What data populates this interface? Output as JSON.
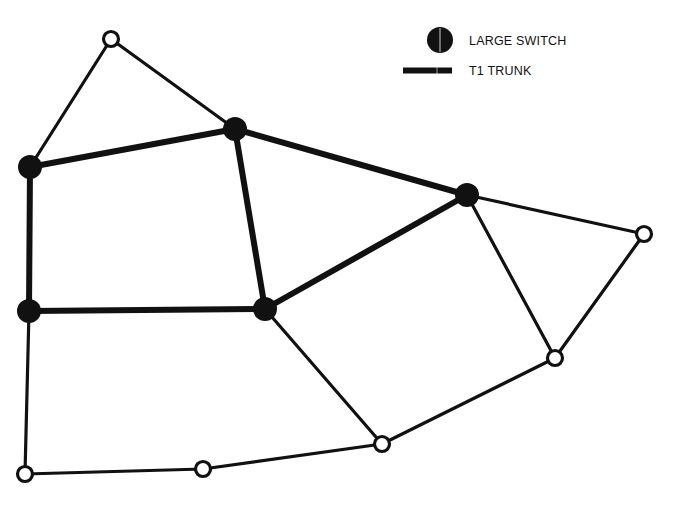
{
  "diagram": {
    "type": "network-topology",
    "colors": {
      "stroke": "#111111",
      "background": "#ffffff",
      "node_fill_open": "#ffffff"
    },
    "legend": {
      "large_switch_label": "LARGE SWITCH",
      "t1_trunk_label": "T1 TRUNK"
    },
    "nodes": [
      {
        "id": "n1",
        "kind": "small",
        "x": 111,
        "y": 39
      },
      {
        "id": "s1",
        "kind": "large-switch",
        "x": 30,
        "y": 167
      },
      {
        "id": "s2",
        "kind": "large-switch",
        "x": 235,
        "y": 129
      },
      {
        "id": "s3",
        "kind": "large-switch",
        "x": 467,
        "y": 195
      },
      {
        "id": "s4",
        "kind": "large-switch",
        "x": 29,
        "y": 311
      },
      {
        "id": "s5",
        "kind": "large-switch",
        "x": 265,
        "y": 309
      },
      {
        "id": "n2",
        "kind": "small",
        "x": 644,
        "y": 234
      },
      {
        "id": "n3",
        "kind": "small",
        "x": 555,
        "y": 358
      },
      {
        "id": "n4",
        "kind": "small",
        "x": 382,
        "y": 444
      },
      {
        "id": "n5",
        "kind": "small",
        "x": 203,
        "y": 469
      },
      {
        "id": "n6",
        "kind": "small",
        "x": 25,
        "y": 474
      }
    ],
    "links": [
      {
        "from": "n1",
        "to": "s1",
        "kind": "normal"
      },
      {
        "from": "n1",
        "to": "s2",
        "kind": "normal"
      },
      {
        "from": "s1",
        "to": "s2",
        "kind": "t1-trunk"
      },
      {
        "from": "s2",
        "to": "s3",
        "kind": "t1-trunk"
      },
      {
        "from": "s2",
        "to": "s5",
        "kind": "t1-trunk"
      },
      {
        "from": "s1",
        "to": "s4",
        "kind": "t1-trunk"
      },
      {
        "from": "s4",
        "to": "s5",
        "kind": "t1-trunk"
      },
      {
        "from": "s5",
        "to": "s3",
        "kind": "t1-trunk"
      },
      {
        "from": "s3",
        "to": "n2",
        "kind": "normal"
      },
      {
        "from": "s3",
        "to": "n3",
        "kind": "normal"
      },
      {
        "from": "n2",
        "to": "n3",
        "kind": "normal"
      },
      {
        "from": "n3",
        "to": "n4",
        "kind": "normal"
      },
      {
        "from": "s5",
        "to": "n4",
        "kind": "normal"
      },
      {
        "from": "n4",
        "to": "n5",
        "kind": "normal"
      },
      {
        "from": "n5",
        "to": "n6",
        "kind": "normal"
      },
      {
        "from": "s4",
        "to": "n6",
        "kind": "normal"
      }
    ]
  }
}
